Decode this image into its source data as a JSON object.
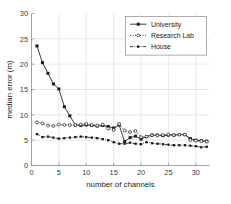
{
  "chart_data": {
    "type": "line",
    "title": "",
    "xlabel": "number of channels",
    "ylabel": "median error (m)",
    "xlim": [
      0,
      32.5
    ],
    "ylim": [
      0,
      30
    ],
    "xticks": [
      0,
      5,
      10,
      15,
      20,
      25,
      30
    ],
    "yticks": [
      0,
      5,
      10,
      15,
      20,
      25,
      30
    ],
    "xticklabels": [
      "0",
      "5",
      "10",
      "15",
      "20",
      "25",
      "30"
    ],
    "yticklabels": [
      "0",
      "5",
      "10",
      "15",
      "20",
      "25",
      "30"
    ],
    "grid": true,
    "legend_position": "upper right",
    "x": [
      1,
      2,
      3,
      4,
      5,
      6,
      7,
      8,
      9,
      10,
      11,
      12,
      13,
      14,
      15,
      16,
      17,
      18,
      19,
      20,
      21,
      22,
      23,
      24,
      25,
      26,
      27,
      28,
      29,
      30,
      31,
      32
    ],
    "series": [
      {
        "name": "University",
        "linestyle": "solid",
        "marker": "filled-square",
        "color": "#1a1a1a",
        "values": [
          23.6,
          20.3,
          18.2,
          16.1,
          15.1,
          11.6,
          9.8,
          8.0,
          7.9,
          8.0,
          7.9,
          7.8,
          7.9,
          7.7,
          7.4,
          8.0,
          4.7,
          5.5,
          5.8,
          5.2,
          5.7,
          6.0,
          6.0,
          5.9,
          6.0,
          6.0,
          6.1,
          6.1,
          5.3,
          5.0,
          4.9,
          4.8
        ]
      },
      {
        "name": "Research Lab",
        "linestyle": "dotted",
        "marker": "open-circle",
        "color": "#1a1a1a",
        "values": [
          8.5,
          8.3,
          7.9,
          7.8,
          8.1,
          8.0,
          8.0,
          8.0,
          8.1,
          8.2,
          8.0,
          7.9,
          8.1,
          7.3,
          7.0,
          8.2,
          6.9,
          6.6,
          6.8,
          5.6,
          5.7,
          6.0,
          5.9,
          6.0,
          6.1,
          6.0,
          6.1,
          6.1,
          5.0,
          4.9,
          4.8,
          4.7
        ]
      },
      {
        "name": "House",
        "linestyle": "dashdot",
        "marker": "small-square",
        "color": "#1a1a1a",
        "values": [
          6.2,
          5.6,
          5.7,
          5.5,
          5.3,
          5.4,
          5.5,
          5.6,
          5.7,
          5.6,
          5.5,
          5.4,
          5.2,
          5.0,
          4.6,
          4.3,
          4.3,
          4.5,
          4.3,
          4.2,
          4.6,
          4.4,
          4.3,
          4.2,
          4.1,
          4.0,
          4.0,
          4.0,
          3.9,
          3.8,
          3.6,
          3.7
        ]
      }
    ]
  },
  "legend": {
    "entries": [
      {
        "label": "University"
      },
      {
        "label": "Research Lab"
      },
      {
        "label": "House"
      }
    ]
  }
}
